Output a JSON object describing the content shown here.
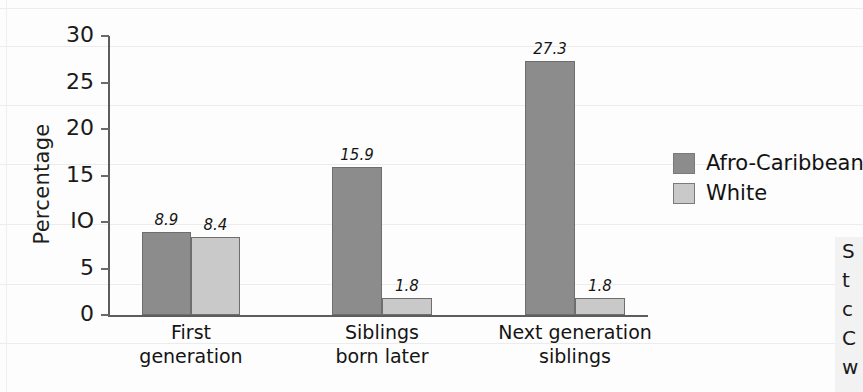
{
  "chart_data": {
    "type": "bar",
    "title": "",
    "xlabel": "",
    "ylabel": "Percentage",
    "ylim": [
      0,
      30
    ],
    "yticks": [
      0,
      5,
      10,
      15,
      20,
      25,
      30
    ],
    "ytick_labels": [
      "0",
      "5",
      "IO",
      "15",
      "20",
      "25",
      "30"
    ],
    "grid": false,
    "legend_position": "right",
    "categories": [
      "First generation",
      "Siblings born later",
      "Next generation siblings"
    ],
    "category_lines": [
      [
        "First",
        "generation"
      ],
      [
        "Siblings",
        "born later"
      ],
      [
        "Next generation",
        "siblings"
      ]
    ],
    "series": [
      {
        "name": "Afro-Caribbean",
        "color": "#8c8c8c",
        "values": [
          8.9,
          15.9,
          27.3
        ],
        "labels": [
          "8.9",
          "15.9",
          "27.3"
        ]
      },
      {
        "name": "White",
        "color": "#c9c9c9",
        "values": [
          8.4,
          1.8,
          1.8
        ],
        "labels": [
          "8.4",
          "1.8",
          "1.8"
        ]
      }
    ]
  },
  "legend": {
    "items": [
      {
        "label": "Afro-Caribbean",
        "swatch": "dark"
      },
      {
        "label": "White",
        "swatch": "light"
      }
    ]
  },
  "side_panel": {
    "visible_lines": [
      "S",
      "t",
      "c",
      "C",
      "w"
    ]
  },
  "colors": {
    "series_dark": "#8c8c8c",
    "series_light": "#c9c9c9",
    "axis": "#5d5d5d",
    "text": "#141414",
    "rule_line": "#ececec",
    "page_background": "#fdfdfd"
  }
}
